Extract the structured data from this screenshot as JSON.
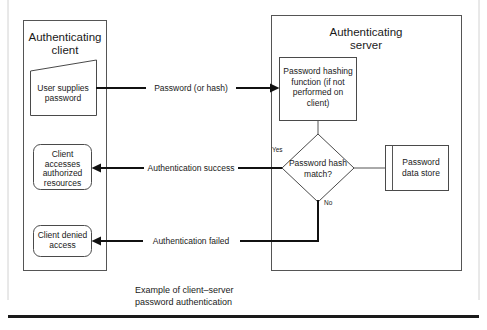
{
  "figure": {
    "caption_line1": "Example of client–server",
    "caption_line2": "password authentication"
  },
  "containers": [
    {
      "id": "client",
      "title_line1": "Authenticating",
      "title_line2": "client"
    },
    {
      "id": "server",
      "title_line1": "Authenticating",
      "title_line2": "server"
    }
  ],
  "nodes": {
    "user_supplies": {
      "shape": "manual-input",
      "line1": "User supplies",
      "line2": "password"
    },
    "client_accesses": {
      "shape": "rounded-rect",
      "line1": "Client",
      "line2": "accesses",
      "line3": "authorized",
      "line4": "resources"
    },
    "client_denied": {
      "shape": "rounded-rect",
      "line1": "Client denied",
      "line2": "access"
    },
    "hashing_function": {
      "shape": "rect",
      "line1": "Password hashing",
      "line2": "function (if not",
      "line3": "performed on",
      "line4": "client)"
    },
    "decision": {
      "shape": "diamond",
      "line1": "Password hash",
      "line2": "match?"
    },
    "data_store": {
      "shape": "stored-data",
      "line1": "Password",
      "line2": "data store"
    }
  },
  "edges": {
    "password_or_hash": "Password (or hash)",
    "auth_success": "Authentication success",
    "auth_failed": "Authentication failed",
    "branch_yes": "Yes",
    "branch_no": "No"
  },
  "colors": {
    "stroke_dark": "#111111",
    "stroke_gray": "#555555",
    "background": "#ffffff",
    "page_edge": "#d2d2d2"
  }
}
